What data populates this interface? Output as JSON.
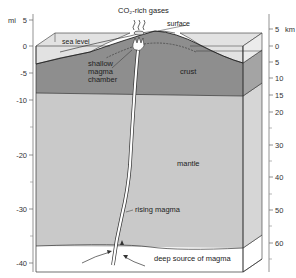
{
  "diagram": {
    "title_labels": {
      "gases": "CO₂-rich gases",
      "surface": "surface",
      "sea_level": "sea level",
      "shallow_chamber_line1": "shallow",
      "shallow_chamber_line2": "magma",
      "shallow_chamber_line3": "chamber",
      "crust": "crust",
      "mantle": "mantle",
      "rising_magma": "rising magma",
      "deep_source": "deep source of magma"
    },
    "left_axis": {
      "unit": "mi",
      "ticks": [
        {
          "label": "5",
          "y": 20
        },
        {
          "label": "0",
          "y": 46
        },
        {
          "label": "-5",
          "y": 73
        },
        {
          "label": "-10",
          "y": 100
        },
        {
          "label": "-20",
          "y": 155
        },
        {
          "label": "-30",
          "y": 209
        },
        {
          "label": "-40",
          "y": 263
        }
      ]
    },
    "right_axis": {
      "unit": "km",
      "ticks": [
        {
          "label": "5",
          "y": 29
        },
        {
          "label": "0",
          "y": 46
        },
        {
          "label": "5",
          "y": 62
        },
        {
          "label": "10",
          "y": 78
        },
        {
          "label": "15",
          "y": 95
        },
        {
          "label": "20",
          "y": 112
        },
        {
          "label": "30",
          "y": 145
        },
        {
          "label": "40",
          "y": 177
        },
        {
          "label": "50",
          "y": 210
        },
        {
          "label": "60",
          "y": 243
        }
      ]
    },
    "colors": {
      "water": "#e2e2e2",
      "crust": "#8e8e8e",
      "mantle": "#c9c9c9",
      "deep_source": "#ffffff",
      "outline": "#333333"
    }
  }
}
